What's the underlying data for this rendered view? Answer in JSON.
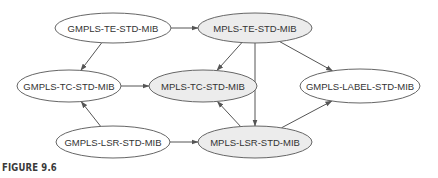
{
  "figure": {
    "caption": "FIGURE 9.6"
  },
  "colors": {
    "edge": "#555555",
    "node_stroke": "#666666",
    "node_fill_plain": "#ffffff",
    "node_fill_shaded": "#ececec"
  },
  "nodes": [
    {
      "id": "gmpls_te",
      "label": "GMPLS-TE-STD-MIB",
      "cx": 113,
      "cy": 28,
      "rx": 58,
      "ry": 15,
      "shaded": false
    },
    {
      "id": "mpls_te",
      "label": "MPLS-TE-STD-MIB",
      "cx": 255,
      "cy": 28,
      "rx": 57,
      "ry": 15,
      "shaded": true
    },
    {
      "id": "gmpls_tc",
      "label": "GMPLS-TC-STD-MIB",
      "cx": 69,
      "cy": 86,
      "rx": 52,
      "ry": 16,
      "shaded": false
    },
    {
      "id": "mpls_tc",
      "label": "MPLS-TC-STD-MIB",
      "cx": 203,
      "cy": 86,
      "rx": 54,
      "ry": 16,
      "shaded": true
    },
    {
      "id": "gmpls_label",
      "label": "GMPLS-LABEL-STD-MIB",
      "cx": 360,
      "cy": 86,
      "rx": 60,
      "ry": 17,
      "shaded": false
    },
    {
      "id": "gmpls_lsr",
      "label": "GMPLS-LSR-STD-MIB",
      "cx": 113,
      "cy": 142,
      "rx": 57,
      "ry": 16,
      "shaded": false
    },
    {
      "id": "mpls_lsr",
      "label": "MPLS-LSR-STD-MIB",
      "cx": 255,
      "cy": 142,
      "rx": 57,
      "ry": 16,
      "shaded": true
    }
  ],
  "edges": [
    {
      "from": "gmpls_te",
      "to": "mpls_te"
    },
    {
      "from": "gmpls_te",
      "to": "gmpls_tc"
    },
    {
      "from": "mpls_te",
      "to": "mpls_tc"
    },
    {
      "from": "mpls_te",
      "to": "mpls_lsr"
    },
    {
      "from": "mpls_te",
      "to": "gmpls_label"
    },
    {
      "from": "gmpls_tc",
      "to": "mpls_tc"
    },
    {
      "from": "gmpls_lsr",
      "to": "gmpls_tc"
    },
    {
      "from": "gmpls_lsr",
      "to": "mpls_lsr"
    },
    {
      "from": "mpls_lsr",
      "to": "mpls_tc"
    },
    {
      "from": "mpls_lsr",
      "to": "gmpls_label"
    }
  ]
}
